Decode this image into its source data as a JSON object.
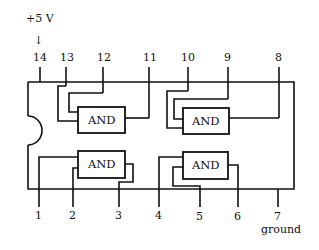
{
  "diagram": {
    "type": "14-pin DIP quad 2-input AND gate IC pinout",
    "supply_label": "+5 V",
    "supply_arrow": "↓",
    "ground_label": "ground",
    "gate_label": "AND",
    "pins": {
      "p1": "1",
      "p2": "2",
      "p3": "3",
      "p4": "4",
      "p5": "5",
      "p6": "6",
      "p7": "7",
      "p8": "8",
      "p9": "9",
      "p10": "10",
      "p11": "11",
      "p12": "12",
      "p13": "13",
      "p14": "14"
    },
    "gates": [
      {
        "name": "AND",
        "inputs": [
          "13",
          "12"
        ],
        "output": "11"
      },
      {
        "name": "AND",
        "inputs": [
          "10",
          "9"
        ],
        "output": "8"
      },
      {
        "name": "AND",
        "inputs": [
          "1",
          "2"
        ],
        "output": "3"
      },
      {
        "name": "AND",
        "inputs": [
          "4",
          "5"
        ],
        "output": "6"
      }
    ],
    "colors": {
      "line": "#111111",
      "background": "#ffffff"
    }
  }
}
